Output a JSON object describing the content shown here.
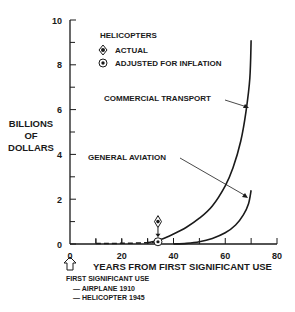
{
  "chart_data": {
    "type": "line",
    "title": "",
    "xlabel": "YEARS FROM FIRST SIGNIFICANT USE",
    "ylabel": "BILLIONS OF DOLLARS",
    "ylabel_lines": [
      "BILLIONS",
      "OF",
      "DOLLARS"
    ],
    "xlim": [
      0,
      80
    ],
    "ylim": [
      0,
      10
    ],
    "x_ticks": [
      0,
      20,
      40,
      60,
      80
    ],
    "y_ticks": [
      0,
      2,
      4,
      6,
      8,
      10
    ],
    "grid": false,
    "series": [
      {
        "name": "COMMERCIAL TRANSPORT",
        "x": [
          30,
          35,
          40,
          45,
          50,
          55,
          60,
          63,
          66,
          68,
          69.5,
          70
        ],
        "y": [
          0.05,
          0.2,
          0.45,
          0.75,
          1.15,
          1.7,
          2.6,
          3.4,
          4.6,
          5.9,
          7.4,
          9.1
        ]
      },
      {
        "name": "GENERAL AVIATION",
        "x": [
          40,
          45,
          50,
          55,
          60,
          64,
          67,
          69,
          70
        ],
        "y": [
          0.0,
          0.03,
          0.1,
          0.25,
          0.5,
          0.85,
          1.3,
          1.8,
          2.4
        ]
      },
      {
        "name": "HELICOPTERS (dashed)",
        "x": [
          10,
          15,
          20,
          25,
          30,
          34
        ],
        "y": [
          0.02,
          0.02,
          0.03,
          0.04,
          0.06,
          0.1
        ]
      }
    ],
    "points": [
      {
        "name": "ACTUAL",
        "x": 34,
        "y": 1.0,
        "marker": "diamond-dot"
      },
      {
        "name": "ADJUSTED FOR INFLATION",
        "x": 34,
        "y": 0.1,
        "marker": "circle-dot"
      }
    ],
    "legend": {
      "title": "HELICOPTERS",
      "entries": [
        "ACTUAL",
        "ADJUSTED FOR INFLATION"
      ],
      "position": "upper-left-inside"
    },
    "annotations": [
      {
        "text": "COMMERCIAL TRANSPORT",
        "points_to": "COMMERCIAL TRANSPORT"
      },
      {
        "text": "GENERAL AVIATION",
        "points_to": "GENERAL AVIATION"
      }
    ],
    "footnote": {
      "arrow_at": 0,
      "lines": [
        "FIRST SIGNIFICANT USE",
        "— AIRPLANE 1910",
        "— HELICOPTER 1945"
      ]
    }
  }
}
